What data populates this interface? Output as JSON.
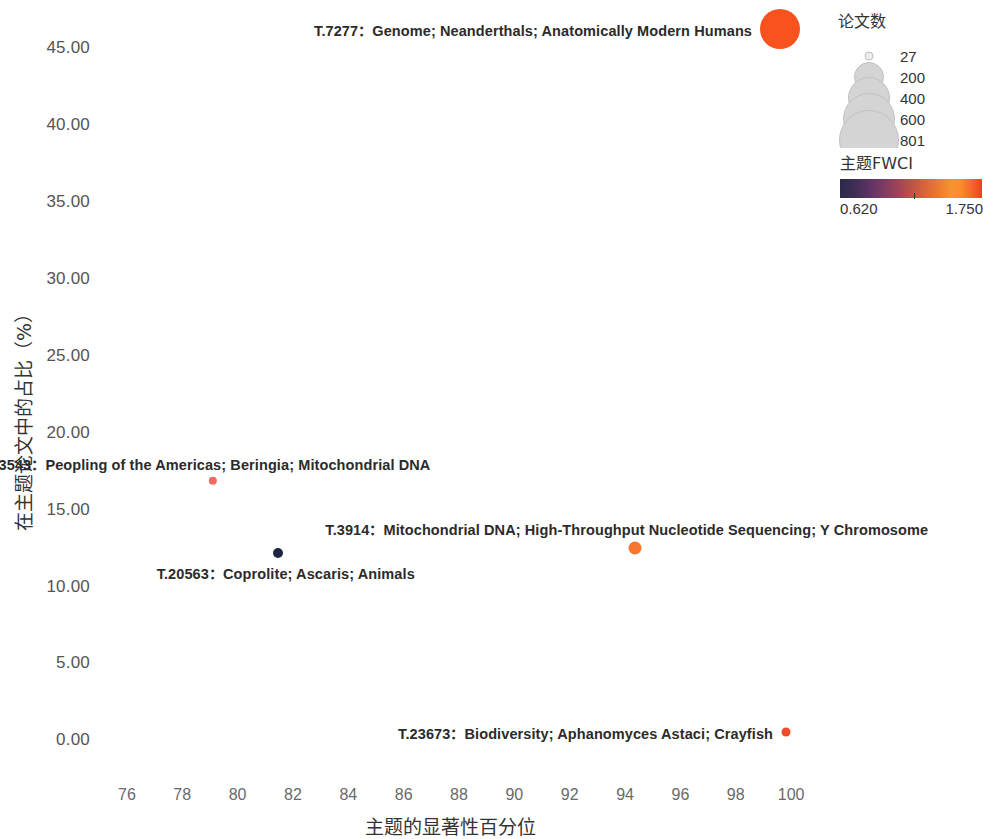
{
  "chart_data": {
    "type": "scatter",
    "title": "",
    "xlabel": "主题的显著性百分位",
    "ylabel": "在主题论文中的占比（%）",
    "xlim": [
      75.1,
      100.9
    ],
    "ylim": [
      -1.4,
      46.8
    ],
    "xticks": [
      76,
      78,
      80,
      82,
      84,
      86,
      88,
      90,
      92,
      94,
      96,
      98,
      100
    ],
    "xtick_labels": [
      "76",
      "78",
      "80",
      "82",
      "84",
      "86",
      "88",
      "90",
      "92",
      "94",
      "96",
      "98",
      "100"
    ],
    "yticks": [
      0,
      5,
      10,
      15,
      20,
      25,
      30,
      35,
      40,
      45
    ],
    "ytick_labels": [
      "0.00",
      "5.00",
      "10.00",
      "15.00",
      "20.00",
      "25.00",
      "30.00",
      "35.00",
      "40.00",
      "45.00"
    ],
    "grid": false,
    "size_encoding": "论文数",
    "color_encoding": "主题FWCI",
    "points": [
      {
        "id": "T.7277",
        "terms": "Genome; Neanderthals; Anatomically Modern Humans",
        "label": "T.7277：Genome; Neanderthals; Anatomically Modern Humans",
        "x": 99.6,
        "y": 46.2,
        "papers": 801,
        "fwci": 1.75,
        "color": "#f9521e",
        "radius_px": 20,
        "label_side": "left"
      },
      {
        "id": "T.13543",
        "terms": "Peopling of the Americas; Beringia; Mitochondrial DNA",
        "label": "T.13543：Peopling of the Americas; Beringia; Mitochondrial DNA",
        "x": 79.1,
        "y": 16.85,
        "papers": 42,
        "fwci": 1.48,
        "color": "#ef6a61",
        "radius_px": 4.2,
        "label_side": "above"
      },
      {
        "id": "T.3914",
        "terms": "Mitochondrial DNA; High-Throughput Nucleotide Sequencing; Y Chromosome",
        "label": "T.3914：Mitochondrial DNA; High-Throughput Nucleotide Sequencing; Y Chromosome",
        "x": 94.35,
        "y": 12.5,
        "papers": 120,
        "fwci": 1.56,
        "color": "#f4762f",
        "radius_px": 6.5,
        "label_side": "above"
      },
      {
        "id": "T.20563",
        "terms": "Coprolite; Ascaris; Animals",
        "label": "T.20563：Coprolite; Ascaris; Animals",
        "x": 81.45,
        "y": 12.15,
        "papers": 60,
        "fwci": 0.62,
        "color": "#1d2542",
        "radius_px": 5,
        "label_side": "below"
      },
      {
        "id": "T.23673",
        "terms": "Biodiversity; Aphanomyces Astaci; Crayfish",
        "label": "T.23673：Biodiversity; Aphanomyces Astaci; Crayfish",
        "x": 99.8,
        "y": 0.55,
        "papers": 27,
        "fwci": 1.6,
        "color": "#ee4b26",
        "radius_px": 4.5,
        "label_side": "left"
      }
    ]
  },
  "size_legend": {
    "title": "论文数",
    "entries": [
      {
        "label": "27",
        "radius_px": 3.5
      },
      {
        "label": "200",
        "radius_px": 14
      },
      {
        "label": "400",
        "radius_px": 20
      },
      {
        "label": "600",
        "radius_px": 25
      },
      {
        "label": "801",
        "radius_px": 29
      }
    ]
  },
  "color_legend": {
    "title": "主题FWCI",
    "min_label": "0.620",
    "max_label": "1.750",
    "tick_position_pct": 52
  }
}
